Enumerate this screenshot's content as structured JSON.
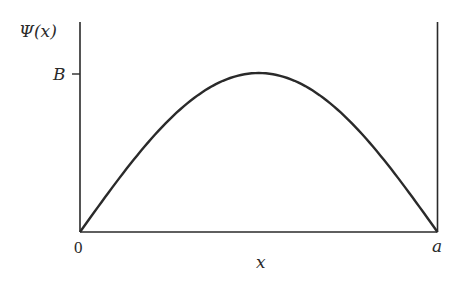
{
  "diagram": {
    "type": "wavefunction-plot",
    "y_axis_label": "Ψ(x)",
    "x_axis_label": "x",
    "y_tick_label": "B",
    "x_tick_labels": {
      "left": "0",
      "right": "a"
    },
    "curve": "half sine arch from 0 to a with maximum B at a/2",
    "colors": {
      "stroke": "#2a2a2a",
      "background": "#ffffff"
    }
  },
  "chart_data": {
    "type": "line",
    "title": "",
    "xlabel": "x",
    "ylabel": "Ψ(x)",
    "x_ticks": [
      "0",
      "a"
    ],
    "y_ticks": [
      "B"
    ],
    "series": [
      {
        "name": "Ψ(x) = B sin(πx/a)",
        "x": [
          0,
          0.25,
          0.5,
          0.75,
          1.0
        ],
        "values": [
          0,
          0.707,
          1.0,
          0.707,
          0
        ]
      }
    ],
    "xlim": [
      0,
      1
    ],
    "ylim": [
      0,
      1.35
    ],
    "grid": false,
    "legend": "none"
  }
}
